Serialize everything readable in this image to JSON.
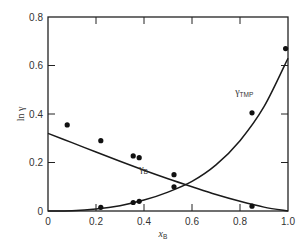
{
  "chart_data": {
    "type": "scatter",
    "title": "",
    "xlabel": "x_B",
    "xlabel_main": "x",
    "xlabel_sub": "B",
    "ylabel": "ln γ",
    "xlim": [
      0,
      1.0
    ],
    "ylim": [
      0,
      0.8
    ],
    "grid": false,
    "x_ticks": [
      0,
      0.2,
      0.4,
      0.6,
      0.8,
      1.0
    ],
    "x_tick_labels": [
      "0",
      "0.2",
      "0.4",
      "0.6",
      "0.8",
      "1.0"
    ],
    "y_ticks": [
      0,
      0.2,
      0.4,
      0.6,
      0.8
    ],
    "y_tick_labels": [
      "0",
      "0.2",
      "0.4",
      "0.6",
      "0.8"
    ],
    "series": [
      {
        "name": "γ_B",
        "label_main": "γ",
        "label_sub": "B",
        "label_pos": [
          0.38,
          0.16
        ],
        "points": [
          {
            "x": 0.08,
            "y": 0.355
          },
          {
            "x": 0.22,
            "y": 0.29
          },
          {
            "x": 0.355,
            "y": 0.227
          },
          {
            "x": 0.38,
            "y": 0.22
          },
          {
            "x": 0.525,
            "y": 0.15
          },
          {
            "x": 0.85,
            "y": 0.02
          }
        ],
        "fit_curve": [
          {
            "x": 0.0,
            "y": 0.32
          },
          {
            "x": 0.1,
            "y": 0.282
          },
          {
            "x": 0.2,
            "y": 0.243
          },
          {
            "x": 0.3,
            "y": 0.205
          },
          {
            "x": 0.4,
            "y": 0.168
          },
          {
            "x": 0.5,
            "y": 0.133
          },
          {
            "x": 0.6,
            "y": 0.1
          },
          {
            "x": 0.7,
            "y": 0.068
          },
          {
            "x": 0.8,
            "y": 0.04
          },
          {
            "x": 0.9,
            "y": 0.016
          },
          {
            "x": 1.0,
            "y": 0.0
          }
        ]
      },
      {
        "name": "γ_TMP",
        "label_main": "γ",
        "label_sub": "TMP",
        "label_pos": [
          0.78,
          0.48
        ],
        "points": [
          {
            "x": 0.22,
            "y": 0.015
          },
          {
            "x": 0.355,
            "y": 0.035
          },
          {
            "x": 0.38,
            "y": 0.04
          },
          {
            "x": 0.525,
            "y": 0.1
          },
          {
            "x": 0.85,
            "y": 0.405
          },
          {
            "x": 0.99,
            "y": 0.67
          }
        ],
        "fit_curve": [
          {
            "x": 0.0,
            "y": 0.0
          },
          {
            "x": 0.1,
            "y": 0.001
          },
          {
            "x": 0.2,
            "y": 0.008
          },
          {
            "x": 0.3,
            "y": 0.022
          },
          {
            "x": 0.4,
            "y": 0.045
          },
          {
            "x": 0.5,
            "y": 0.078
          },
          {
            "x": 0.6,
            "y": 0.122
          },
          {
            "x": 0.7,
            "y": 0.19
          },
          {
            "x": 0.8,
            "y": 0.29
          },
          {
            "x": 0.9,
            "y": 0.43
          },
          {
            "x": 1.0,
            "y": 0.63
          }
        ]
      }
    ]
  }
}
